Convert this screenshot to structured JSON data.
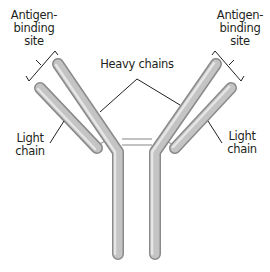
{
  "diagram": {
    "type": "antibody-structure",
    "labels": {
      "antigen_binding_left": [
        "Antigen-",
        "binding",
        "site"
      ],
      "antigen_binding_right": [
        "Antigen-",
        "binding",
        "site"
      ],
      "heavy_chains": "Heavy chains",
      "light_chain_left": [
        "Light",
        "chain"
      ],
      "light_chain_right": [
        "Light",
        "chain"
      ]
    },
    "colors": {
      "chain_fill": "#b8b8b8",
      "chain_highlight": "#e2e2e2",
      "chain_shadow": "#8c8c8c",
      "leader_line": "#231f20",
      "text": "#231f20",
      "background": "#ffffff"
    }
  }
}
